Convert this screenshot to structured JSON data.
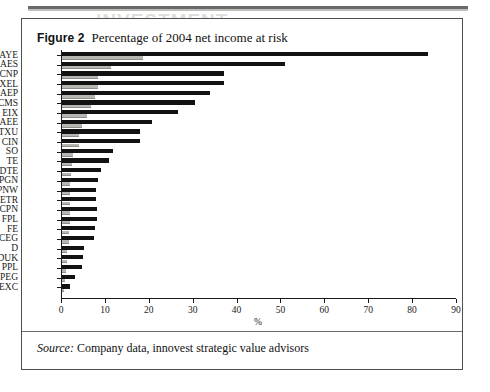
{
  "figure": {
    "label": "Figure 2",
    "title": "Percentage of 2004 net income at risk",
    "source_keyword": "Source:",
    "source_text": "Company data, innovest strategic value advisors",
    "ghost_bleed": "INVESTMENT"
  },
  "chart_data": {
    "type": "bar",
    "orientation": "horizontal",
    "title": "Percentage of 2004 net income at risk",
    "xlabel": "%",
    "ylabel": "",
    "xlim": [
      0,
      90
    ],
    "xticks": [
      0,
      10,
      20,
      30,
      40,
      50,
      60,
      70,
      80,
      90
    ],
    "grid": false,
    "legend": false,
    "categories": [
      "AYE",
      "AES",
      "CNP",
      "XEL",
      "AEP",
      "CMS",
      "EIX",
      "AEE",
      "TXU",
      "CIN",
      "SO",
      "TE",
      "DTE",
      "PGN",
      "PNW",
      "ETR",
      "CPN",
      "FPL",
      "FE",
      "CEG",
      "D",
      "DUK",
      "PPL",
      "PEG",
      "EXC"
    ],
    "values": [
      83.4,
      50.7,
      37.0,
      37.0,
      33.8,
      30.2,
      26.4,
      20.5,
      17.8,
      17.8,
      11.6,
      10.7,
      8.9,
      8.2,
      7.8,
      7.8,
      8.0,
      8.0,
      7.5,
      7.3,
      5.0,
      4.8,
      4.6,
      3.0,
      1.8
    ],
    "bar_color": "#121212",
    "axis_color": "#1a1a1a"
  }
}
